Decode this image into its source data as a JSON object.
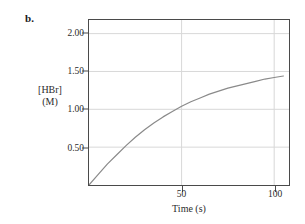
{
  "figure": {
    "panel_label": "b."
  },
  "chart_data": {
    "type": "line",
    "title": "",
    "xlabel": "Time (s)",
    "ylabel_line1": "[HBr]",
    "ylabel_line2": "(M)",
    "xlim": [
      0,
      108
    ],
    "ylim": [
      0,
      2.18
    ],
    "grid": true,
    "legend": "none",
    "x_ticks": [
      50,
      100
    ],
    "x_tick_labels": [
      "50",
      "100"
    ],
    "y_ticks": [
      0.5,
      1.0,
      1.5,
      2.0
    ],
    "y_tick_labels": [
      "0.50",
      "1.00",
      "1.50",
      "2.00"
    ],
    "series": [
      {
        "name": "[HBr]",
        "color": "#8a8a8a",
        "x": [
          0,
          5,
          10,
          15,
          20,
          25,
          30,
          35,
          40,
          45,
          50,
          55,
          60,
          65,
          70,
          75,
          80,
          85,
          90,
          95,
          100,
          105
        ],
        "values": [
          0.0,
          0.14,
          0.28,
          0.4,
          0.52,
          0.63,
          0.73,
          0.82,
          0.9,
          0.97,
          1.04,
          1.1,
          1.15,
          1.2,
          1.24,
          1.28,
          1.31,
          1.34,
          1.37,
          1.4,
          1.42,
          1.44
        ]
      }
    ],
    "colors": {
      "curve": "#8a8a8a",
      "frame": "#4a4a4a",
      "grid": "#d8d8d8",
      "text": "#2b2b2b",
      "background": "#ffffff"
    }
  }
}
